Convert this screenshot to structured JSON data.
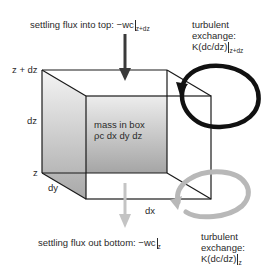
{
  "labels": {
    "top_flux_prefix": "settling flux into top: −wc",
    "top_flux_sub": "z+dz",
    "bottom_flux_prefix": "settling flux out bottom: −wc",
    "bottom_flux_sub": "z",
    "turb_top_line1": "turbulent",
    "turb_top_line2": "exchange:",
    "turb_top_line3": "K(dc/dz)",
    "turb_top_sub": "z+dz",
    "turb_bottom_line1": "turbulent",
    "turb_bottom_line2": "exchange:",
    "turb_bottom_line3": "K(dc/dz)",
    "turb_bottom_sub": "z",
    "box_line1": "mass in box",
    "box_line2": "ρc dx dy dz",
    "z_top": "z + dz",
    "z_bottom": "z",
    "dz": "dz",
    "dy": "dy",
    "dx": "dx"
  },
  "colors": {
    "dark_arrow": "#3a3a3a",
    "light_arrow": "#c4c4c4",
    "black_loop": "#111111",
    "gray_loop": "#b8b8b8",
    "shade_top": "#f2f2f2",
    "shade_bottom": "#a9a9a9"
  }
}
